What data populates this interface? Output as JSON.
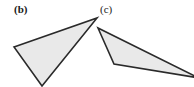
{
  "figure": {
    "background_color": "#ffffff",
    "width": 194,
    "height": 87,
    "panels": [
      {
        "id": "b",
        "label": "(b)",
        "label_bold": true,
        "label_x": 14,
        "label_y": 4
      },
      {
        "id": "c",
        "label": "(c)",
        "label_bold": false,
        "label_x": 100,
        "label_y": 4
      }
    ]
  },
  "chart_data": {
    "type": "diagram",
    "title": "",
    "shapes": [
      {
        "name": "triangle-b",
        "panel": "b",
        "kind": "triangle",
        "fill": "#e9e9e9",
        "stroke": "#2a2a2a",
        "stroke_width": 1.6,
        "points": "14,47 97,18 42,86"
      },
      {
        "name": "triangle-c",
        "panel": "c",
        "kind": "triangle",
        "fill": "#e9e9e9",
        "stroke": "#2a2a2a",
        "stroke_width": 1.6,
        "points": "98,28 114,64 199,78"
      }
    ],
    "colors": {
      "shape_fill": "#e9e9e9",
      "shape_stroke": "#2a2a2a",
      "label_color": "#1a1a1a",
      "background": "#ffffff"
    }
  }
}
